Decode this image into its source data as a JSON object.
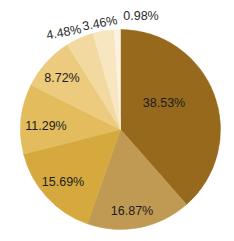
{
  "chart_data": {
    "type": "pie",
    "title": "",
    "subtitle": "",
    "xlabel": "",
    "ylabel": "",
    "legend_position": "none",
    "grid": false,
    "start_angle_deg": 0,
    "direction": "clockwise",
    "categories": [
      "38.53%",
      "16.87%",
      "15.69%",
      "11.29%",
      "8.72%",
      "4.48%",
      "3.46%",
      "0.98%"
    ],
    "values": [
      38.53,
      16.87,
      15.69,
      11.29,
      8.72,
      4.48,
      3.46,
      0.98
    ],
    "labels": [
      "38.53%",
      "16.87%",
      "15.69%",
      "11.29%",
      "8.72%",
      "4.48%",
      "3.46%",
      "0.98%"
    ],
    "colors": [
      "#96691c",
      "#c09a53",
      "#d6a93f",
      "#e3bc5e",
      "#ecca7e",
      "#f2d99f",
      "#f7e6c0",
      "#fbf3e0"
    ]
  },
  "geometry": {
    "center_x": 120.5,
    "center_y": 129.5,
    "radius": 100
  },
  "slices": [
    {
      "label": "38.53%",
      "value": 38.53,
      "color": "#96691c",
      "label_x": 164,
      "label_y": 104,
      "label_rotation": 0,
      "label_placement": "inside",
      "label_anchor": "middle"
    },
    {
      "label": "16.87%",
      "value": 16.87,
      "color": "#c09a53",
      "label_x": 132,
      "label_y": 212,
      "label_rotation": 0,
      "label_placement": "inside",
      "label_anchor": "middle"
    },
    {
      "label": "15.69%",
      "value": 15.69,
      "color": "#d6a93f",
      "label_x": 63,
      "label_y": 183,
      "label_rotation": 0,
      "label_placement": "inside",
      "label_anchor": "middle"
    },
    {
      "label": "11.29%",
      "value": 11.29,
      "color": "#e3bc5e",
      "label_x": 46,
      "label_y": 127,
      "label_rotation": 0,
      "label_placement": "inside",
      "label_anchor": "middle"
    },
    {
      "label": "8.72%",
      "value": 8.72,
      "color": "#ecca7e",
      "label_x": 62,
      "label_y": 79,
      "label_rotation": 0,
      "label_placement": "inside",
      "label_anchor": "middle"
    },
    {
      "label": "4.48%",
      "value": 4.48,
      "color": "#f2d99f",
      "label_x": 64,
      "label_y": 33,
      "label_rotation": -11,
      "label_placement": "outside",
      "label_anchor": "middle"
    },
    {
      "label": "3.46%",
      "value": 3.46,
      "color": "#f7e6c0",
      "label_x": 100,
      "label_y": 24,
      "label_rotation": -11,
      "label_placement": "outside",
      "label_anchor": "middle"
    },
    {
      "label": "0.98%",
      "value": 0.98,
      "color": "#fbf3e0",
      "label_x": 141,
      "label_y": 17,
      "label_rotation": 0,
      "label_placement": "outside",
      "label_anchor": "middle"
    }
  ],
  "footer": {
    "clipped_caption_fragments": [
      "",
      "",
      "",
      "",
      ""
    ]
  }
}
